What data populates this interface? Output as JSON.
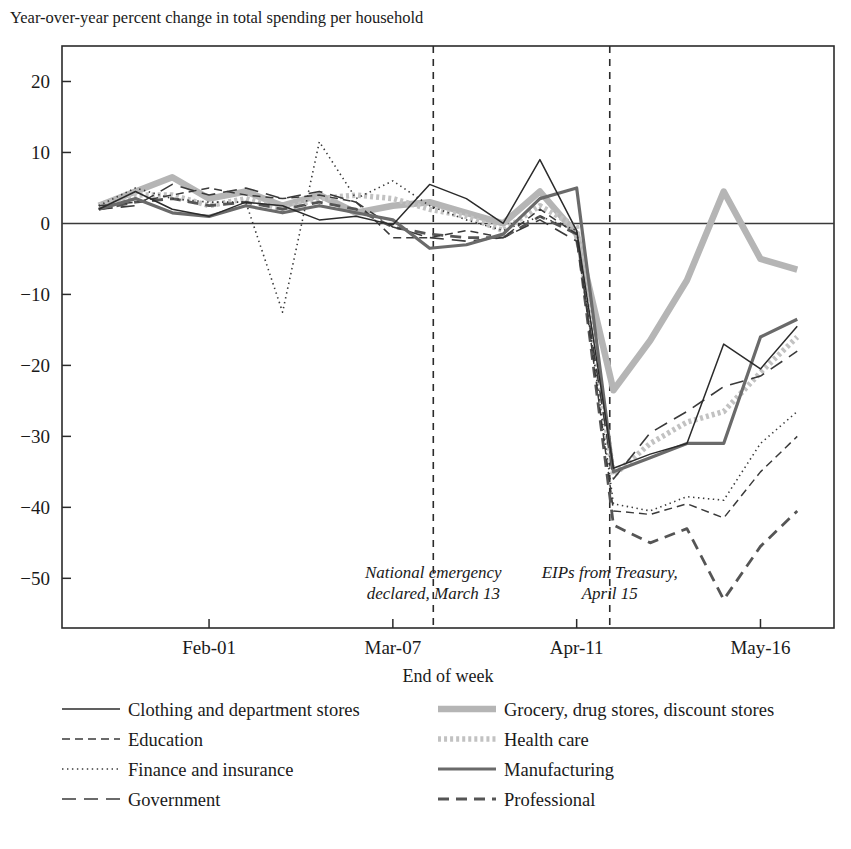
{
  "chart_data": {
    "type": "line",
    "title": "Year-over-year percent change in total spending per household",
    "xlabel": "End of week",
    "ylabel": "",
    "ylim": [
      -57,
      25
    ],
    "xlim": [
      0,
      21
    ],
    "grid": false,
    "legend_position": "below-plot-two-columns",
    "ytick_labels": [
      "20",
      "10",
      "0",
      "−10",
      "−20",
      "−30",
      "−40",
      "−50"
    ],
    "ytick_values": [
      20,
      10,
      0,
      -10,
      -20,
      -30,
      -40,
      -50
    ],
    "xtick_labels": [
      "Feb-01",
      "Mar-07",
      "Apr-11",
      "May-16"
    ],
    "xtick_values": [
      4,
      9,
      14,
      19
    ],
    "x_index": [
      1,
      2,
      3,
      4,
      5,
      6,
      7,
      8,
      9,
      10,
      11,
      12,
      13,
      14,
      15,
      16,
      17,
      18,
      19,
      20
    ],
    "annotations": [
      {
        "name": "national-emergency",
        "line1": "National emergency",
        "line2": "declared, March 13",
        "x_value": 10.1
      },
      {
        "name": "eips-treasury",
        "line1": "EIPs from Treasury,",
        "line2": "April 15",
        "x_value": 14.9
      }
    ],
    "series": [
      {
        "name": "Clothing and department stores",
        "style": "solid-thin",
        "color": "#2b2b2b",
        "width": 1.5,
        "dash": "none",
        "values": [
          2.0,
          4.5,
          2.0,
          1.0,
          3.0,
          2.5,
          0.5,
          1.0,
          -0.2,
          5.5,
          3.5,
          0.0,
          9.0,
          -1.0,
          -34.5,
          -32.5,
          -31.0,
          -17.0,
          -20.5,
          -14.5
        ]
      },
      {
        "name": "Education",
        "style": "dashed-short",
        "color": "#3a3a3a",
        "width": 1.5,
        "dash": "8 5",
        "values": [
          2.5,
          3.0,
          4.0,
          5.0,
          4.0,
          3.5,
          4.0,
          3.0,
          -2.0,
          -2.0,
          -1.0,
          -2.0,
          2.0,
          -1.5,
          -40.5,
          -41.0,
          -39.5,
          -41.5,
          -35.0,
          -30.0
        ]
      },
      {
        "name": "Finance and insurance",
        "style": "dotted",
        "color": "#3a3a3a",
        "width": 1.6,
        "dash": "2 3",
        "values": [
          2.5,
          5.0,
          3.5,
          3.0,
          3.0,
          -12.5,
          11.5,
          3.5,
          6.0,
          2.5,
          0.5,
          -1.0,
          1.0,
          -1.0,
          -39.5,
          -40.5,
          -38.5,
          -39.0,
          -31.0,
          -26.5
        ]
      },
      {
        "name": "Government",
        "style": "dashed-long",
        "color": "#3a3a3a",
        "width": 1.6,
        "dash": "14 8",
        "values": [
          2.0,
          2.5,
          5.5,
          4.0,
          5.0,
          3.5,
          4.5,
          3.0,
          -0.5,
          -2.0,
          -2.5,
          -2.0,
          0.5,
          -2.5,
          -36.0,
          -29.5,
          -26.5,
          -23.0,
          -21.5,
          -18.0
        ]
      },
      {
        "name": "Grocery, drug stores, discount stores",
        "style": "solid-thick-light",
        "color": "#b5b5b5",
        "width": 6.5,
        "dash": "none",
        "values": [
          2.5,
          4.5,
          6.5,
          3.5,
          4.5,
          2.5,
          4.0,
          1.5,
          2.5,
          3.0,
          1.5,
          0.0,
          4.5,
          -1.5,
          -23.5,
          -16.5,
          -8.0,
          4.5,
          -5.0,
          -6.5
        ]
      },
      {
        "name": "Health care",
        "style": "dotted-thick-light",
        "color": "#c2c2c2",
        "width": 5.5,
        "dash": "3 3",
        "values": [
          2.5,
          4.0,
          4.0,
          2.5,
          3.5,
          2.0,
          3.5,
          4.0,
          3.5,
          2.0,
          1.0,
          -1.0,
          2.5,
          -0.5,
          -35.5,
          -31.0,
          -28.0,
          -26.5,
          -21.0,
          -16.0
        ]
      },
      {
        "name": "Manufacturing",
        "style": "solid-medium",
        "color": "#6a6a6a",
        "width": 3.2,
        "dash": "none",
        "values": [
          2.0,
          3.5,
          1.5,
          1.0,
          2.5,
          1.5,
          2.5,
          1.5,
          0.5,
          -3.5,
          -3.0,
          -1.5,
          3.5,
          5.0,
          -35.0,
          -33.0,
          -31.0,
          -31.0,
          -16.0,
          -13.5
        ]
      },
      {
        "name": "Professional",
        "style": "dashed-medium",
        "color": "#555555",
        "width": 2.8,
        "dash": "11 7",
        "values": [
          2.0,
          3.0,
          3.5,
          2.5,
          3.0,
          2.0,
          3.0,
          2.0,
          -0.5,
          -1.5,
          -2.0,
          -2.0,
          1.0,
          -1.5,
          -42.5,
          -45.0,
          -43.0,
          -53.0,
          -45.5,
          -40.5
        ]
      }
    ]
  },
  "legend": {
    "column_left": [
      {
        "label": "Clothing and department stores",
        "series": "Clothing and department stores"
      },
      {
        "label": "Education",
        "series": "Education"
      },
      {
        "label": "Finance and insurance",
        "series": "Finance and insurance"
      },
      {
        "label": "Government",
        "series": "Government"
      }
    ],
    "column_right": [
      {
        "label": "Grocery, drug stores, discount stores",
        "series": "Grocery, drug stores, discount stores"
      },
      {
        "label": "Health care",
        "series": "Health care"
      },
      {
        "label": "Manufacturing",
        "series": "Manufacturing"
      },
      {
        "label": "Professional",
        "series": "Professional"
      }
    ]
  },
  "colors": {
    "axis": "#2b2b2b",
    "text": "#1a1a1a",
    "background": "#ffffff",
    "grocery": "#b5b5b5",
    "health_care": "#c2c2c2",
    "manufacturing": "#6a6a6a",
    "professional": "#555555"
  }
}
